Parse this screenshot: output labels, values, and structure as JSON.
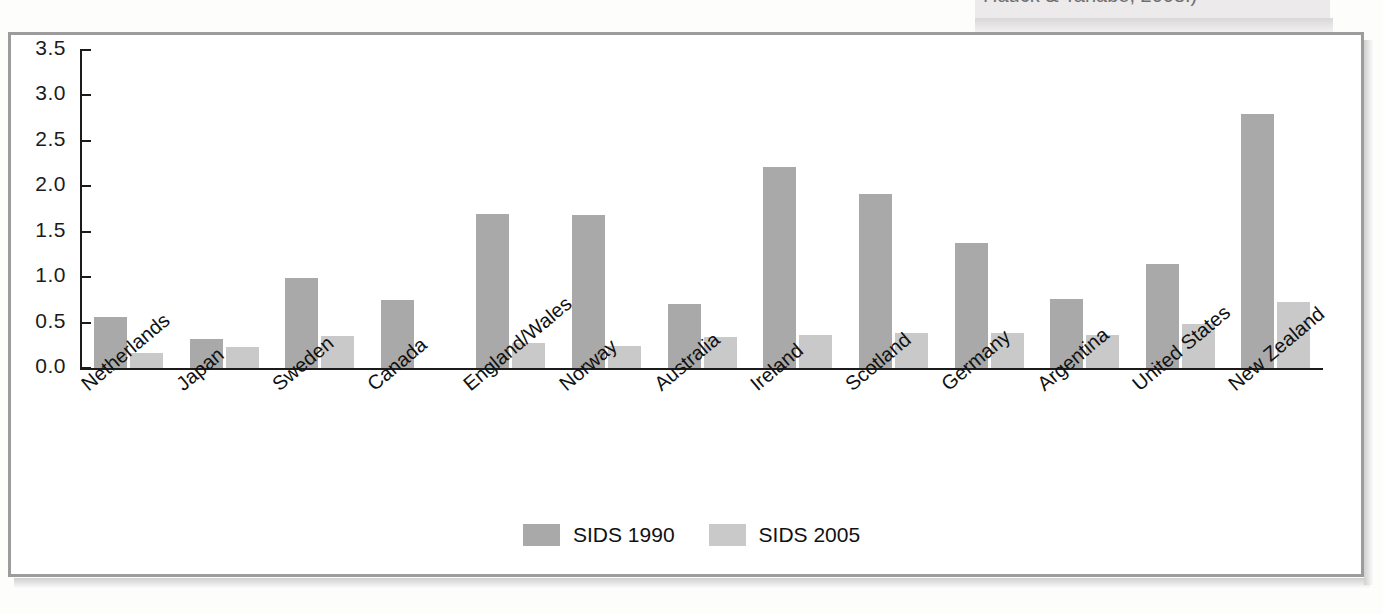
{
  "caption": {
    "text": "Hauck & Tanabe, 2008.)"
  },
  "colors": {
    "series_1990": "#a9a9a9",
    "series_2005": "#c9c9c9",
    "axis": "#1b1b1b",
    "frame": "#9c9c9c",
    "page_background": "#fdfdfc"
  },
  "chart_data": {
    "type": "bar",
    "title": "",
    "subtitle": "",
    "xlabel": "",
    "ylabel": "",
    "ylim": [
      0.0,
      3.5
    ],
    "ytick_labels": [
      "0.0",
      "0.5",
      "1.0",
      "1.5",
      "2.0",
      "2.5",
      "3.0",
      "3.5"
    ],
    "ytick_values": [
      0.0,
      0.5,
      1.0,
      1.5,
      2.0,
      2.5,
      3.0,
      3.5
    ],
    "grid": false,
    "legend_position": "bottom-center",
    "categories": [
      "Netherlands",
      "Japan",
      "Sweden",
      "Canada",
      "England/Wales",
      "Norway",
      "Australia",
      "Ireland",
      "Scotland",
      "Germany",
      "Argentina",
      "United States",
      "New Zealand"
    ],
    "series": [
      {
        "name": "SIDS 1990",
        "color": "#a9a9a9",
        "values": [
          0.56,
          0.32,
          0.99,
          0.75,
          1.69,
          1.68,
          0.7,
          2.21,
          1.92,
          1.38,
          0.76,
          1.14,
          2.8
        ]
      },
      {
        "name": "SIDS 2005",
        "color": "#c9c9c9",
        "values": [
          0.17,
          0.23,
          0.35,
          0.0,
          0.28,
          0.24,
          0.34,
          0.36,
          0.38,
          0.39,
          0.36,
          0.48,
          0.73
        ]
      }
    ]
  },
  "legend": {
    "items": [
      {
        "label": "SIDS 1990",
        "color": "#a9a9a9"
      },
      {
        "label": "SIDS 2005",
        "color": "#c9c9c9"
      }
    ]
  }
}
